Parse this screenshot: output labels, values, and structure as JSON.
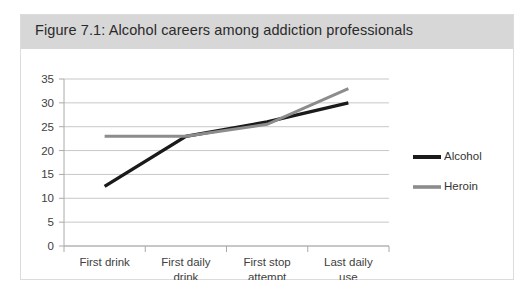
{
  "figure": {
    "title": "Figure 7.1: Alcohol careers among addiction professionals"
  },
  "colors": {
    "panel_background": "#ffffff",
    "panel_border": "#dcdcdc",
    "title_band": "#d7d7d7",
    "title_text": "#2a2a2a",
    "gridline": "#c8c8c8",
    "axis": "#aaaaaa",
    "alcohol": "#1a1a1a",
    "heroin": "#8c8c8c",
    "tick_label": "#404040"
  },
  "chart_data": {
    "type": "line",
    "title": "Figure 7.1: Alcohol careers among addiction professionals",
    "xlabel": "",
    "ylabel": "",
    "categories": [
      "First drink",
      "First daily drink",
      "First stop attempt",
      "Last daily use"
    ],
    "series": [
      {
        "name": "Alcohol",
        "values": [
          12.5,
          23,
          26,
          30
        ],
        "color": "#1a1a1a"
      },
      {
        "name": "Heroin",
        "values": [
          23,
          23,
          25.5,
          33
        ],
        "color": "#8c8c8c"
      }
    ],
    "ylim": [
      0,
      35
    ],
    "ytick_labels": [
      "0",
      "5",
      "10",
      "15",
      "20",
      "25",
      "30",
      "35"
    ],
    "ytick_values": [
      0,
      5,
      10,
      15,
      20,
      25,
      30,
      35
    ],
    "grid": "horizontal",
    "legend_position": "right",
    "legend_entries": [
      "Alcohol",
      "Heroin"
    ]
  }
}
